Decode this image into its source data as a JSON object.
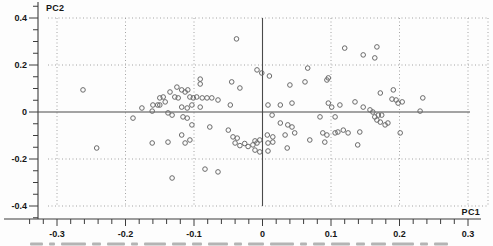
{
  "chart_data": {
    "type": "scatter",
    "title": "",
    "xlabel": "PC1",
    "ylabel": "PC2",
    "xlim": [
      -0.33,
      0.33
    ],
    "ylim": [
      -0.46,
      0.47
    ],
    "x_major_ticks": [
      -0.3,
      -0.2,
      -0.1,
      0,
      0.1,
      0.2,
      0.3
    ],
    "x_tick_labels": [
      "-0.3",
      "-0.2",
      "-0.1",
      "0",
      "0.1",
      "0.2",
      "0.3"
    ],
    "y_major_ticks": [
      0.4,
      0.2,
      0,
      -0.2,
      -0.4
    ],
    "y_tick_labels": [
      "0.4",
      "0.2",
      "0",
      "-0.2",
      "-0.4"
    ],
    "x_minor_step": 0.02,
    "y_minor_step": 0.05,
    "grid": "dotted-at-major-ticks",
    "legend": "none",
    "zero_reference_lines": true,
    "marker": "open-circle",
    "points": [
      [
        -0.262,
        0.094
      ],
      [
        -0.242,
        -0.153
      ],
      [
        -0.189,
        -0.026
      ],
      [
        -0.176,
        0.017
      ],
      [
        -0.161,
        0.004
      ],
      [
        -0.153,
        0.03
      ],
      [
        -0.16,
        0.03
      ],
      [
        -0.15,
        0.06
      ],
      [
        -0.15,
        0.03
      ],
      [
        -0.145,
        0.064
      ],
      [
        -0.142,
        0.043
      ],
      [
        -0.138,
        -0.004
      ],
      [
        -0.135,
        0.085
      ],
      [
        -0.132,
        -0.013
      ],
      [
        -0.128,
        0.064
      ],
      [
        -0.125,
        0.106
      ],
      [
        -0.123,
        0.06
      ],
      [
        -0.118,
        0.094
      ],
      [
        -0.118,
        0.021
      ],
      [
        -0.116,
        -0.021
      ],
      [
        -0.113,
        0.085
      ],
      [
        -0.11,
        0.017
      ],
      [
        -0.11,
        -0.026
      ],
      [
        -0.109,
        0.094
      ],
      [
        -0.106,
        0.064
      ],
      [
        -0.103,
        0.03
      ],
      [
        -0.101,
        0.06
      ],
      [
        -0.096,
        0.064
      ],
      [
        -0.091,
        0.14
      ],
      [
        -0.091,
        0.119
      ],
      [
        -0.091,
        0.021
      ],
      [
        -0.088,
        0.06
      ],
      [
        -0.081,
        0.06
      ],
      [
        -0.074,
        0.06
      ],
      [
        -0.065,
        0.051
      ],
      [
        -0.047,
        0.03
      ],
      [
        -0.045,
        0.128
      ],
      [
        -0.033,
        0.102
      ],
      [
        -0.038,
        0.311
      ],
      [
        -0.008,
        0.179
      ],
      [
        -0.001,
        0.166
      ],
      [
        0.01,
        0.153
      ],
      [
        -0.103,
        -0.055
      ],
      [
        -0.077,
        -0.064
      ],
      [
        -0.05,
        -0.077
      ],
      [
        -0.118,
        -0.098
      ],
      [
        -0.106,
        -0.119
      ],
      [
        -0.161,
        -0.132
      ],
      [
        -0.138,
        -0.128
      ],
      [
        -0.113,
        -0.132
      ],
      [
        -0.043,
        -0.106
      ],
      [
        -0.037,
        -0.111
      ],
      [
        -0.04,
        -0.132
      ],
      [
        -0.033,
        -0.143
      ],
      [
        -0.026,
        -0.134
      ],
      [
        -0.021,
        -0.147
      ],
      [
        -0.014,
        -0.14
      ],
      [
        -0.011,
        -0.123
      ],
      [
        -0.008,
        -0.132
      ],
      [
        -0.011,
        -0.162
      ],
      [
        -0.004,
        -0.17
      ],
      [
        -0.004,
        -0.119
      ],
      [
        -0.084,
        -0.243
      ],
      [
        -0.065,
        -0.255
      ],
      [
        -0.132,
        -0.281
      ],
      [
        0.008,
        -0.132
      ],
      [
        0.008,
        -0.166
      ],
      [
        0.015,
        -0.128
      ],
      [
        0.036,
        -0.153
      ],
      [
        0.007,
        -0.098
      ],
      [
        0.015,
        -0.106
      ],
      [
        0.033,
        -0.098
      ],
      [
        0.047,
        -0.089
      ],
      [
        0.026,
        -0.047
      ],
      [
        0.037,
        -0.055
      ],
      [
        0.043,
        -0.064
      ],
      [
        0.014,
        -0.013
      ],
      [
        0.084,
        -0.021
      ],
      [
        0.106,
        -0.021
      ],
      [
        0.088,
        -0.089
      ],
      [
        0.094,
        -0.098
      ],
      [
        0.106,
        -0.089
      ],
      [
        0.11,
        -0.085
      ],
      [
        0.118,
        -0.077
      ],
      [
        0.125,
        -0.089
      ],
      [
        0.142,
        -0.085
      ],
      [
        0.069,
        -0.119
      ],
      [
        0.091,
        -0.128
      ],
      [
        0.139,
        -0.14
      ],
      [
        0.201,
        -0.089
      ],
      [
        0.167,
        -0.034
      ],
      [
        0.172,
        -0.043
      ],
      [
        0.179,
        -0.055
      ],
      [
        0.183,
        -0.047
      ],
      [
        0.164,
        -0.021
      ],
      [
        0.169,
        -0.013
      ],
      [
        0.174,
        -0.013
      ],
      [
        0.008,
        0.03
      ],
      [
        0.026,
        0.03
      ],
      [
        0.043,
        0.038
      ],
      [
        0.04,
        0.115
      ],
      [
        0.062,
        0.128
      ],
      [
        0.066,
        0.187
      ],
      [
        0.094,
        0.136
      ],
      [
        0.096,
        0.145
      ],
      [
        0.096,
        0.038
      ],
      [
        0.101,
        0.021
      ],
      [
        0.113,
        0.03
      ],
      [
        0.135,
        0.043
      ],
      [
        0.147,
        0.021
      ],
      [
        0.157,
        0.009
      ],
      [
        0.161,
        0.0
      ],
      [
        0.172,
        0.081
      ],
      [
        0.191,
        0.094
      ],
      [
        0.189,
        0.055
      ],
      [
        0.195,
        0.051
      ],
      [
        0.198,
        0.038
      ],
      [
        0.204,
        0.043
      ],
      [
        0.23,
        0.004
      ],
      [
        0.234,
        0.06
      ],
      [
        0.12,
        0.272
      ],
      [
        0.167,
        0.277
      ],
      [
        0.147,
        0.243
      ],
      [
        0.164,
        0.23
      ]
    ]
  },
  "colors": {
    "background": "#fdfdfd",
    "axis": "#3c3c3c",
    "grid": "#9a9a9a",
    "marker": "#6a6a6a",
    "label": "#161616"
  },
  "caption_strip": {
    "word_widths": [
      13,
      6,
      25,
      9,
      18,
      7,
      22,
      14,
      10,
      20,
      8,
      16,
      24,
      7,
      12,
      19,
      9,
      15,
      22,
      8,
      14
    ]
  }
}
